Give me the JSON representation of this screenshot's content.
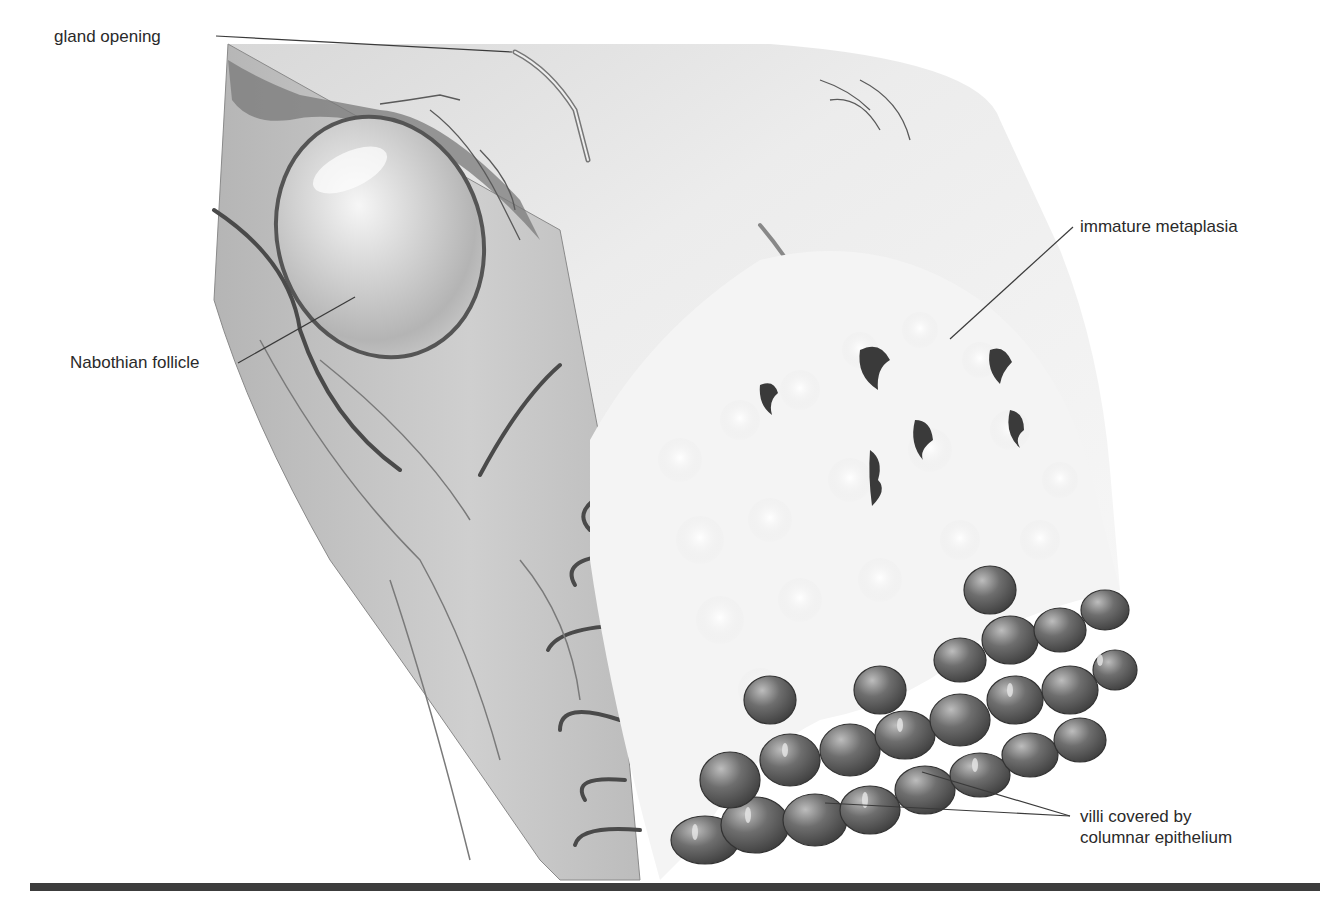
{
  "figure": {
    "labels": [
      {
        "id": "gland-opening",
        "text": "gland opening",
        "x": 54,
        "y": 26,
        "anchor": "left",
        "leader": [
          [
            216,
            36
          ],
          [
            512,
            52
          ]
        ]
      },
      {
        "id": "nabothian-follicle",
        "text": "Nabothian follicle",
        "x": 70,
        "y": 352,
        "anchor": "left",
        "leader": [
          [
            238,
            363
          ],
          [
            355,
            297
          ]
        ]
      },
      {
        "id": "immature-metaplasia",
        "text": "immature metaplasia",
        "x": 1080,
        "y": 216,
        "anchor": "right",
        "leader": [
          [
            1073,
            227
          ],
          [
            950,
            339
          ]
        ]
      },
      {
        "id": "villi-columnar-epithelium",
        "line1": "villi covered by",
        "line2": "columnar epithelium",
        "x": 1080,
        "y": 816,
        "anchor": "right",
        "leaders": [
          [
            [
              1070,
              816
            ],
            [
              922,
              772
            ]
          ],
          [
            [
              1070,
              816
            ],
            [
              825,
              803
            ]
          ]
        ]
      }
    ],
    "colors": {
      "label_text": "#2a2a2a",
      "leader_line": "#3a3a3a",
      "bottom_rule": "#3c3c3c",
      "tissue_light": "#f2f2f2",
      "tissue_mid": "#bdbdbd",
      "villi_dark": "#5a5a5a"
    }
  }
}
